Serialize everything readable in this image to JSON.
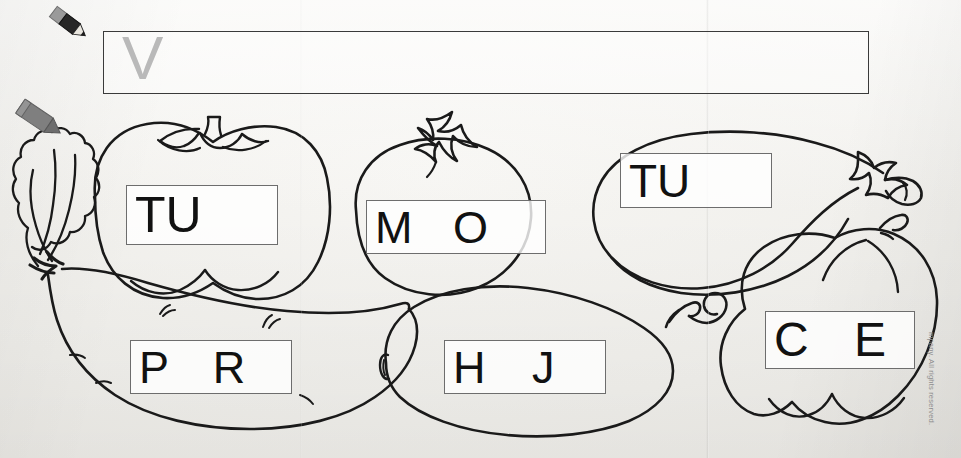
{
  "worksheet": {
    "answer_box": {
      "traced_letter": "V",
      "placeholder": ""
    },
    "copyright": "mpany. All rights reserved.",
    "stationery": [
      {
        "name": "pencil-icon",
        "color": "#2b2b2b"
      },
      {
        "name": "crayon-icon",
        "color": "#7d7d7d"
      }
    ],
    "vegetables": [
      {
        "name": "carrot",
        "icon": "carrot-icon",
        "letters": "P R",
        "box_id": "box-pr"
      },
      {
        "name": "pumpkin",
        "icon": "pumpkin-icon",
        "letters": "TU",
        "box_id": "box-tu1"
      },
      {
        "name": "tomato",
        "icon": "tomato-icon",
        "letters": "M O",
        "box_id": "box-mo"
      },
      {
        "name": "eggplant",
        "icon": "eggplant-icon",
        "letters": "TU",
        "box_id": "box-tu2"
      },
      {
        "name": "zucchini",
        "icon": "zucchini-icon",
        "letters": "H J",
        "box_id": "box-hj"
      },
      {
        "name": "bell-pepper",
        "icon": "bell-pepper-icon",
        "letters": "C E",
        "box_id": "box-ce"
      }
    ]
  }
}
